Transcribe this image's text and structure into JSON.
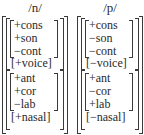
{
  "matrices": [
    {
      "segment": "/n/",
      "group1": {
        "features": [
          "+cons",
          "+son",
          "−cont"
        ],
        "single": "[+voice]"
      },
      "group2": {
        "features": [
          "+ant",
          "+cor",
          "−lab"
        ],
        "single": "[+nasal]"
      }
    },
    {
      "segment": "/p/",
      "group1": {
        "features": [
          "+cons",
          "−son",
          "−cont"
        ],
        "single": "[−voice]"
      },
      "group2": {
        "features": [
          "+ant",
          "−cor",
          "+lab"
        ],
        "single": "[−nasal]"
      }
    }
  ]
}
